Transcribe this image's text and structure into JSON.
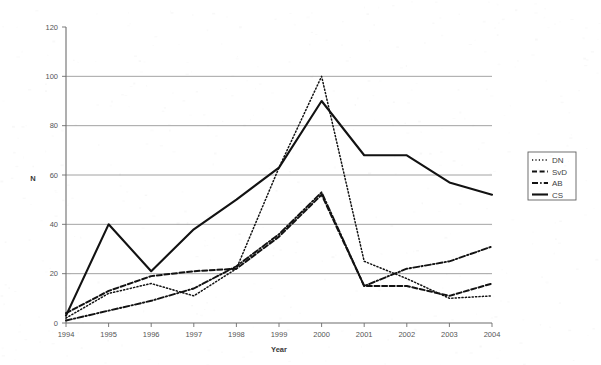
{
  "chart_data": {
    "type": "line",
    "title": "",
    "xlabel": "Year",
    "ylabel": "N",
    "x": [
      1994,
      1995,
      1996,
      1997,
      1998,
      1999,
      2000,
      2001,
      2002,
      2003,
      2004
    ],
    "xtick_labels": [
      "1994",
      "1995",
      "1996",
      "1997",
      "1998",
      "1999",
      "2000",
      "2001",
      "2002",
      "2003",
      "2004"
    ],
    "ytick_labels": [
      "0",
      "20",
      "40",
      "60",
      "80",
      "100",
      "120"
    ],
    "ytick_values": [
      0,
      20,
      40,
      60,
      80,
      100,
      120
    ],
    "ylim": [
      0,
      120
    ],
    "xlim": [
      1994,
      2004
    ],
    "grid": "horizontal",
    "legend_position": "right",
    "series": [
      {
        "name": "DN",
        "line_style": "dotted",
        "color": "#121212",
        "values": [
          2,
          12,
          16,
          11,
          22,
          63,
          100,
          25,
          18,
          10,
          11
        ]
      },
      {
        "name": "SvD",
        "line_style": "dashed",
        "color": "#121212",
        "values": [
          4,
          13,
          19,
          21,
          22,
          35,
          52,
          15,
          15,
          11,
          16
        ]
      },
      {
        "name": "AB",
        "line_style": "dash-dot",
        "color": "#121212",
        "values": [
          1,
          5,
          9,
          14,
          23,
          36,
          53,
          15,
          22,
          25,
          31
        ]
      },
      {
        "name": "CS",
        "line_style": "solid",
        "color": "#121212",
        "values": [
          3,
          40,
          21,
          38,
          50,
          63,
          90,
          68,
          68,
          57,
          52
        ]
      }
    ]
  },
  "legend": {
    "items": [
      {
        "label": "DN"
      },
      {
        "label": "SvD"
      },
      {
        "label": "AB"
      },
      {
        "label": "CS"
      }
    ]
  }
}
